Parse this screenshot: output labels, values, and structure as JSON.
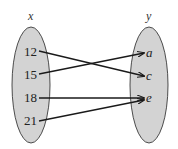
{
  "diagram": {
    "type": "function-mapping",
    "domain_set": {
      "label": "x",
      "elements": [
        "12",
        "15",
        "18",
        "21"
      ]
    },
    "codomain_set": {
      "label": "y",
      "elements": [
        "a",
        "c",
        "e"
      ]
    },
    "mappings": [
      {
        "from": "12",
        "to": "c"
      },
      {
        "from": "15",
        "to": "a"
      },
      {
        "from": "18",
        "to": "e"
      },
      {
        "from": "21",
        "to": "e"
      }
    ],
    "colors": {
      "ellipse_fill": "#d3d3d3",
      "ellipse_stroke": "#3a3a3a",
      "arrow": "#1a1a1a",
      "text": "#222222"
    }
  }
}
